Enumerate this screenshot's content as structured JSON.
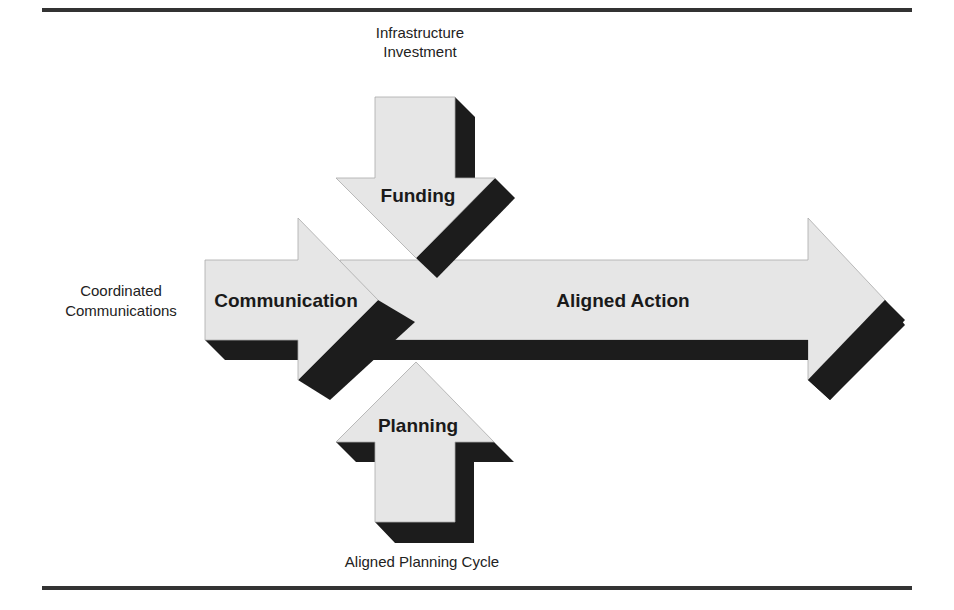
{
  "diagram": {
    "colors": {
      "arrow_fill": "#e6e6e6",
      "shadow": "#1c1c1c",
      "rule": "#333333",
      "outline": "#999999"
    },
    "arrows": {
      "main": {
        "label": "Aligned Action"
      },
      "left": {
        "label": "Communication",
        "caption_line1": "Coordinated",
        "caption_line2": "Communications"
      },
      "top": {
        "label": "Funding",
        "caption_line1": "Infrastructure",
        "caption_line2": "Investment"
      },
      "bottom": {
        "label": "Planning",
        "caption": "Aligned Planning Cycle"
      }
    }
  }
}
